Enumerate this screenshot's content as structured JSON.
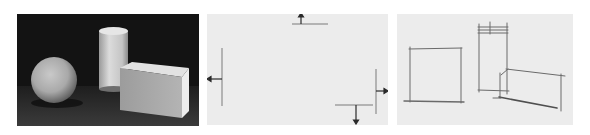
{
  "figure": {
    "panels": [
      {
        "id": "photo",
        "description": "Photograph of plaster still life: sphere, cylinder, rectangular box on dark background",
        "objects": [
          "sphere",
          "cylinder",
          "rectangular-box"
        ]
      },
      {
        "id": "sketch-arrows",
        "description": "Blank sketch sheet with boundary tick marks and outward arrows",
        "arrows": [
          "up",
          "left",
          "right",
          "down"
        ]
      },
      {
        "id": "sketch-blocks",
        "description": "Light pencil block-in of the three objects",
        "shapes": [
          "square",
          "tall-rectangle",
          "tilted-box"
        ]
      }
    ],
    "colors": {
      "page_bg": "#ffffff",
      "photo_bg": "#131313",
      "paper_bg": "#ececec",
      "pencil": "#6a6a6a",
      "arrow": "#2a2a2a"
    }
  }
}
